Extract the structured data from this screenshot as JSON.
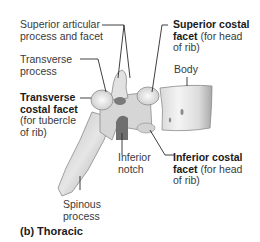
{
  "caption": "(b) Thoracic",
  "labels": {
    "superior_articular": {
      "line1": "Superior articular",
      "line2": "process and facet"
    },
    "transverse_process": {
      "line1": "Transverse",
      "line2": "process"
    },
    "transverse_costal": {
      "bold1": "Transverse",
      "bold2": "costal facet",
      "line3": "(for tubercle",
      "line4": "of rib)"
    },
    "superior_costal": {
      "bold1": "Superior costal",
      "bold2": "facet",
      "rest2": " (for head",
      "line3": "of rib)"
    },
    "body": {
      "text": "Body"
    },
    "inferior_notch": {
      "line1": "Inferior",
      "line2": "notch"
    },
    "inferior_costal": {
      "bold1": "Inferior costal",
      "bold2": "facet",
      "rest2": " (for head",
      "line3": "of rib)"
    },
    "spinous_process": {
      "line1": "Spinous",
      "line2": "process"
    }
  },
  "colors": {
    "bone_light": "#efefef",
    "bone_mid": "#cfcfcf",
    "bone_dark": "#8f8f8f",
    "leader": "#2a2a2a"
  }
}
